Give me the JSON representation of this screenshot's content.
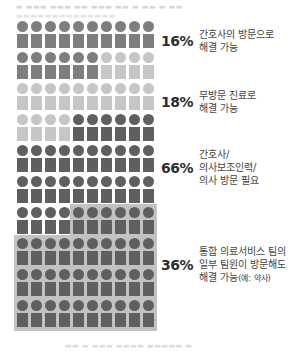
{
  "chart_data": {
    "type": "waffle",
    "grid": {
      "rows": 10,
      "cols": 10
    },
    "title": "",
    "series": [
      {
        "name": "간호사의 방문으로 해결 가능",
        "value": 16,
        "percent_label": "16%",
        "color": "#7e7e7e"
      },
      {
        "name": "무방문 진료로 해결 가능",
        "value": 18,
        "percent_label": "18%",
        "color": "#c6c6c6"
      },
      {
        "name": "간호사/의사보조인력/의사 방문 필요",
        "value": 66,
        "percent_label": "66%",
        "color": "#5f5f5f"
      }
    ],
    "overlay": {
      "name": "통합 의료서비스 팀의 일부 팀원이 방문해도 해결 가능(예: 약사)",
      "value": 36,
      "percent_label": "36%",
      "subset_of": "간호사/의사보조인력/의사 방문 필요",
      "highlight_color": "#c2c2c2"
    },
    "legend_position": "right"
  },
  "labels": [
    {
      "pct": "16%",
      "lines": [
        "간호사의 방문으로",
        "해결 가능"
      ]
    },
    {
      "pct": "18%",
      "lines": [
        "무방문 진료로",
        "해결 가능"
      ]
    },
    {
      "pct": "66%",
      "lines": [
        "간호사/",
        "의사보조인력/",
        "의사 방문 필요"
      ]
    },
    {
      "pct": "36%",
      "lines": [
        "통합 의료서비스 팀의",
        "일부 팀원이 방문해도",
        "해결 가능"
      ],
      "note": "(예: 약사)"
    }
  ]
}
